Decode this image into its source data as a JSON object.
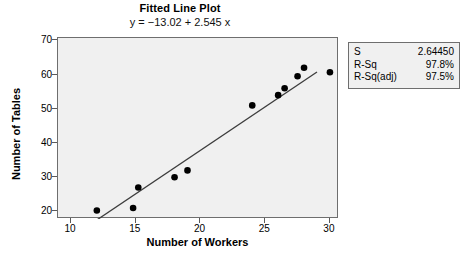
{
  "chart_data": {
    "type": "scatter",
    "title": "Fitted Line Plot",
    "subtitle": "y = −13.02 + 2.545 x",
    "xlabel": "Number of Workers",
    "ylabel": "Number of Tables",
    "xlim": [
      9.0,
      30.7
    ],
    "ylim": [
      17.8,
      70.7
    ],
    "xticks": [
      10,
      15,
      20,
      25,
      30
    ],
    "yticks": [
      20,
      30,
      40,
      50,
      60,
      70
    ],
    "grid": false,
    "legend": "none",
    "points": [
      {
        "x": 12.0,
        "y": 20.3
      },
      {
        "x": 14.8,
        "y": 21.0
      },
      {
        "x": 15.2,
        "y": 27.0
      },
      {
        "x": 18.0,
        "y": 30.0
      },
      {
        "x": 19.0,
        "y": 32.0
      },
      {
        "x": 24.0,
        "y": 51.0
      },
      {
        "x": 26.0,
        "y": 54.0
      },
      {
        "x": 26.5,
        "y": 56.0
      },
      {
        "x": 27.5,
        "y": 59.5
      },
      {
        "x": 28.0,
        "y": 62.0
      },
      {
        "x": 30.0,
        "y": 60.7
      }
    ],
    "fit_line": {
      "intercept": -13.02,
      "slope": 2.545,
      "x_start": 12.0,
      "x_end": 29.0
    },
    "marker_color": "#000000",
    "line_color": "#3c3c3c",
    "plot_background": "#f0f0f0"
  },
  "stats": {
    "rows": [
      {
        "key": "S",
        "value": "2.64450"
      },
      {
        "key": "R-Sq",
        "value": "97.8%"
      },
      {
        "key": "R-Sq(adj)",
        "value": "97.5%"
      }
    ]
  }
}
